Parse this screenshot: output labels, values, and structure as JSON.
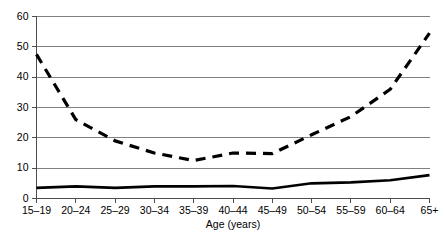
{
  "chart_data": {
    "type": "line",
    "title": "",
    "subtitle": "",
    "xlabel": "Age (years)",
    "ylabel": "",
    "categories": [
      "15–19",
      "20–24",
      "25–29",
      "30–34",
      "35–39",
      "40–44",
      "45–49",
      "50–54",
      "55–59",
      "60–64",
      "65+"
    ],
    "ylim": [
      0,
      60
    ],
    "yticks": [
      0,
      10,
      20,
      30,
      40,
      50,
      60
    ],
    "ytick_labels": [
      "0",
      "10",
      "20",
      "30",
      "40",
      "50",
      "60"
    ],
    "grid": true,
    "legend": "none",
    "series": [
      {
        "name": "dashed-series",
        "style": "dashed",
        "color": "#000000",
        "values": [
          47.5,
          26.0,
          19.0,
          15.0,
          12.5,
          15.0,
          14.8,
          21.0,
          27.0,
          36.0,
          54.5
        ]
      },
      {
        "name": "solid-series",
        "style": "solid",
        "color": "#000000",
        "values": [
          3.5,
          4.0,
          3.5,
          4.0,
          4.0,
          4.1,
          3.3,
          5.0,
          5.3,
          6.0,
          7.7
        ]
      }
    ]
  },
  "colors": {
    "background": "#ffffff",
    "gridline": "#808080",
    "axis": "#4d4d4d",
    "series": "#000000"
  }
}
